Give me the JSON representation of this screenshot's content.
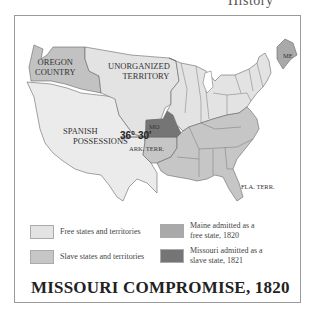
{
  "header_fragment": "History",
  "colors": {
    "free": "#e3e3e3",
    "slave": "#c6c6c6",
    "maine": "#a9a9a9",
    "missouri": "#757575",
    "border": "#666666",
    "water": "#ffffff"
  },
  "map": {
    "labels": {
      "oregon": [
        "OREGON",
        "COUNTRY"
      ],
      "unorganized": [
        "UNORGANIZED",
        "TERRITORY"
      ],
      "spanish": [
        "SPANISH",
        "POSSESSIONS"
      ],
      "missouri": "MO",
      "maine": "ME",
      "latitude": "36° 30'",
      "arkansas": "ARK. TERR.",
      "florida": "FLA. TERR."
    }
  },
  "legend": {
    "items": [
      {
        "key": "free",
        "label": [
          "Free states and territories"
        ]
      },
      {
        "key": "slave",
        "label": [
          "Slave states and territories"
        ]
      },
      {
        "key": "maine",
        "label": [
          "Maine admitted as a",
          "free state, 1820"
        ]
      },
      {
        "key": "missouri",
        "label": [
          "Missouri admitted as a",
          "slave state, 1821"
        ]
      }
    ]
  },
  "title": "MISSOURI COMPROMISE, 1820"
}
